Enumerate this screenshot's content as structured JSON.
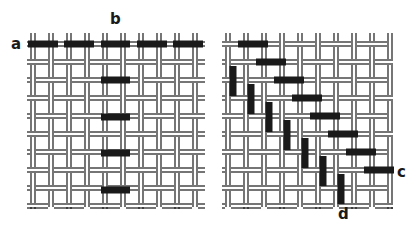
{
  "figure": {
    "colors": {
      "thread_line": "#1a1a1a",
      "float": "#1a1a1a",
      "background": "#ffffff"
    }
  },
  "panels": [
    {
      "id": "left",
      "bounds": {
        "x0": 27,
        "x1": 205,
        "y0": 33,
        "y1": 207
      },
      "labels": [
        {
          "text": "a",
          "x": 11,
          "y": 49
        },
        {
          "text": "b",
          "x": 110,
          "y": 24
        }
      ],
      "h_floats": [
        {
          "x0": 28,
          "x1": 58,
          "y": 44
        },
        {
          "x0": 64,
          "x1": 94,
          "y": 44
        },
        {
          "x0": 101,
          "x1": 130,
          "y": 44
        },
        {
          "x0": 137,
          "x1": 167,
          "y": 44
        },
        {
          "x0": 173,
          "x1": 203,
          "y": 44
        },
        {
          "x0": 101,
          "x1": 130,
          "y": 80
        },
        {
          "x0": 101,
          "x1": 130,
          "y": 117
        },
        {
          "x0": 101,
          "x1": 130,
          "y": 153
        },
        {
          "x0": 101,
          "x1": 130,
          "y": 190
        }
      ],
      "v_floats": []
    },
    {
      "id": "right",
      "bounds": {
        "x0": 222,
        "x1": 393,
        "y0": 33,
        "y1": 207
      },
      "labels": [
        {
          "text": "c",
          "x": 397,
          "y": 177
        },
        {
          "text": "d",
          "x": 338,
          "y": 219
        }
      ],
      "h_floats": [
        {
          "x0": 238,
          "x1": 268,
          "y": 44
        },
        {
          "x0": 256,
          "x1": 286,
          "y": 62
        },
        {
          "x0": 274,
          "x1": 304,
          "y": 80
        },
        {
          "x0": 292,
          "x1": 322,
          "y": 98
        },
        {
          "x0": 310,
          "x1": 340,
          "y": 116
        },
        {
          "x0": 328,
          "x1": 358,
          "y": 134
        },
        {
          "x0": 346,
          "x1": 376,
          "y": 152
        },
        {
          "x0": 364,
          "x1": 394,
          "y": 170
        }
      ],
      "v_floats": [
        {
          "x": 233,
          "y0": 66,
          "y1": 96
        },
        {
          "x": 251,
          "y0": 84,
          "y1": 114
        },
        {
          "x": 269,
          "y0": 102,
          "y1": 132
        },
        {
          "x": 287,
          "y0": 120,
          "y1": 150
        },
        {
          "x": 305,
          "y0": 138,
          "y1": 168
        },
        {
          "x": 323,
          "y0": 156,
          "y1": 186
        },
        {
          "x": 341,
          "y0": 174,
          "y1": 204
        }
      ]
    }
  ],
  "weave": {
    "pitch": 18,
    "thread_gap": 4,
    "float_thickness": 7
  }
}
